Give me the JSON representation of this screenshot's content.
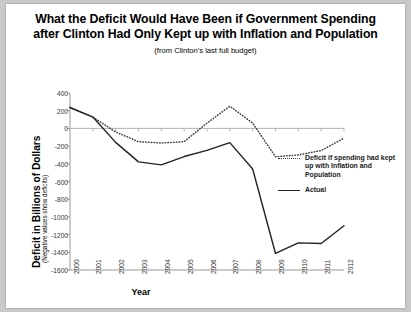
{
  "figure": {
    "title_lines": [
      "What the Deficit Would Have Been if Government Spending",
      "after Clinton Had Only Kept up with Inflation and Population"
    ],
    "subtitle": "(from Clinton's last full budget)"
  },
  "axes": {
    "ylabel_main": "Deficit in Billions of Dollars",
    "ylabel_sub": "(Negative values show deficits)",
    "xlabel": "Year"
  },
  "legend": {
    "items": [
      {
        "label": "Deficit if spending had kept up with Inflation and Population",
        "style": "dotted"
      },
      {
        "label": "Actual",
        "style": "solid"
      }
    ]
  },
  "chart_data": {
    "type": "line",
    "title": "What the Deficit Would Have Been if Government Spending after Clinton Had Only Kept up with Inflation and Population",
    "subtitle": "(from Clinton's last full budget)",
    "xlabel": "Year",
    "ylabel": "Deficit in Billions of Dollars (Negative values show deficits)",
    "x": [
      2000,
      2001,
      2002,
      2003,
      2004,
      2005,
      2006,
      2007,
      2008,
      2009,
      2010,
      2011,
      2012
    ],
    "xtick_labels": [
      "2000",
      "2001",
      "2002",
      "2003",
      "2004",
      "2005",
      "2006",
      "2007",
      "2008",
      "2009",
      "2010",
      "2011",
      "2012"
    ],
    "ytick_labels": [
      "400",
      "200",
      "0",
      "-200",
      "-400",
      "-600",
      "-800",
      "-1000",
      "-1200",
      "-1400",
      "-1600"
    ],
    "yticks": [
      400,
      200,
      0,
      -200,
      -400,
      -600,
      -800,
      -1000,
      -1200,
      -1400,
      -1600
    ],
    "ylim": [
      -1650,
      420
    ],
    "xlim": [
      2000,
      2012
    ],
    "grid": false,
    "zero_line": true,
    "legend_position": "right",
    "series": [
      {
        "name": "Deficit if spending had kept up with Inflation and Population",
        "style": "dotted",
        "color": "#444444",
        "values": [
          236,
          128,
          -40,
          -150,
          -165,
          -150,
          60,
          250,
          60,
          -320,
          -300,
          -250,
          -110
        ]
      },
      {
        "name": "Actual",
        "style": "solid",
        "color": "#222222",
        "values": [
          236,
          128,
          -158,
          -378,
          -412,
          -318,
          -248,
          -161,
          -459,
          -1413,
          -1294,
          -1300,
          -1100
        ]
      }
    ]
  }
}
